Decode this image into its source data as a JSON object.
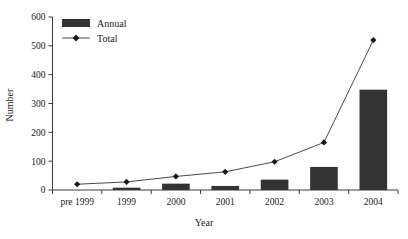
{
  "chart_data": {
    "type": "bar",
    "title": "",
    "xlabel": "Year",
    "ylabel": "Number",
    "categories": [
      "pre 1999",
      "1999",
      "2000",
      "2001",
      "2002",
      "2003",
      "2004"
    ],
    "ylim": [
      0,
      600
    ],
    "yticks": [
      0,
      100,
      200,
      300,
      400,
      500,
      600
    ],
    "ytick_labels": [
      "0",
      "100",
      "200",
      "300",
      "400",
      "500",
      "600"
    ],
    "grid": false,
    "legend_position": "top-left",
    "series": [
      {
        "name": "Annual",
        "kind": "bar",
        "color": "#333333",
        "values": [
          0,
          8,
          22,
          14,
          36,
          80,
          348
        ]
      },
      {
        "name": "Total",
        "kind": "line",
        "color": "#4a4a4a",
        "marker": "diamond",
        "values": [
          20,
          28,
          47,
          63,
          98,
          165,
          520
        ]
      }
    ]
  },
  "legend": {
    "items": [
      {
        "label": "Annual",
        "swatch": "bar-swatch"
      },
      {
        "label": "Total",
        "swatch": "line-marker-swatch"
      }
    ]
  },
  "axes": {
    "x_title": "Year",
    "y_title": "Number"
  }
}
